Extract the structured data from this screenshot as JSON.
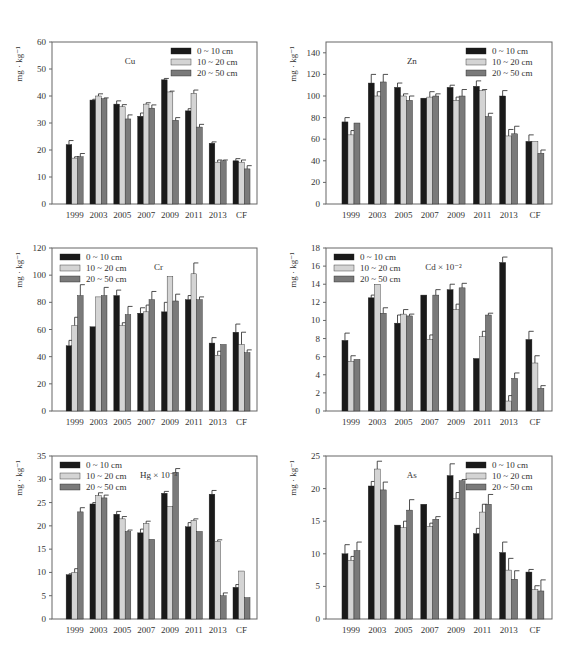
{
  "legend": [
    "0 ~ 10 cm",
    "10 ~ 20 cm",
    "20 ~ 50 cm"
  ],
  "colors": {
    "s1": "#1a1a1a",
    "s2": "#d4d4d4",
    "s3": "#7a7a7a",
    "axis": "#555555"
  },
  "chart_data": [
    {
      "type": "bar",
      "title": "Cu",
      "ylabel": "mg · kg⁻¹",
      "ylim": [
        0,
        60
      ],
      "yticks": [
        0,
        10,
        20,
        30,
        40,
        50,
        60
      ],
      "categories": [
        "1999",
        "2003",
        "2005",
        "2007",
        "2009",
        "2011",
        "2013",
        "CF"
      ],
      "legend_position": "top-right",
      "series": [
        {
          "name": "0 ~ 10 cm",
          "values": [
            22,
            38.5,
            37,
            32.5,
            46,
            34.5,
            22.5,
            16
          ],
          "errors": [
            1.5,
            0.3,
            1.2,
            1.2,
            0.5,
            0.8,
            0.5,
            0.8
          ]
        },
        {
          "name": "10 ~ 20 cm",
          "values": [
            17,
            40,
            36,
            37,
            41.5,
            41,
            15.5,
            15.5
          ],
          "errors": [
            0.5,
            0.8,
            0.8,
            0.5,
            0.3,
            1.2,
            0.8,
            0.8
          ]
        },
        {
          "name": "20 ~ 50 cm",
          "values": [
            17.5,
            39,
            31.5,
            35.5,
            31,
            28.5,
            16,
            13
          ],
          "errors": [
            1.2,
            0.3,
            1.5,
            1.2,
            1,
            1,
            0.3,
            1.2
          ]
        }
      ]
    },
    {
      "type": "bar",
      "title": "Zn",
      "ylabel": "mg · kg⁻¹",
      "ylim": [
        0,
        150
      ],
      "yticks": [
        0,
        20,
        40,
        60,
        80,
        100,
        120,
        140
      ],
      "categories": [
        "1999",
        "2003",
        "2005",
        "2007",
        "2009",
        "2011",
        "2013",
        "CF"
      ],
      "legend_position": "top-right",
      "series": [
        {
          "name": "0 ~ 10 cm",
          "values": [
            76,
            112,
            108,
            98,
            108,
            109,
            100,
            58
          ],
          "errors": [
            4,
            8,
            4,
            0,
            2,
            5,
            5,
            6
          ]
        },
        {
          "name": "10 ~ 20 cm",
          "values": [
            64,
            100,
            100,
            99,
            96,
            105,
            63,
            58
          ],
          "errors": [
            4,
            4,
            2,
            5,
            3,
            1,
            6,
            0
          ]
        },
        {
          "name": "20 ~ 50 cm",
          "values": [
            75,
            113,
            96,
            100,
            100,
            81,
            65,
            47
          ],
          "errors": [
            0,
            7,
            4,
            2,
            6,
            3,
            7,
            3
          ]
        }
      ]
    },
    {
      "type": "bar",
      "title": "Cr",
      "ylabel": "mg · kg⁻¹",
      "ylim": [
        0,
        120
      ],
      "yticks": [
        0,
        20,
        40,
        60,
        80,
        100,
        120
      ],
      "categories": [
        "1999",
        "2003",
        "2005",
        "2007",
        "2009",
        "2011",
        "2013",
        "CF"
      ],
      "legend_position": "top-left",
      "series": [
        {
          "name": "0 ~ 10 cm",
          "values": [
            48,
            62,
            85,
            72,
            73,
            82,
            50,
            58
          ],
          "errors": [
            4,
            0,
            4,
            4,
            7,
            3,
            4,
            6
          ]
        },
        {
          "name": "10 ~ 20 cm",
          "values": [
            63,
            84,
            63,
            73,
            99,
            101,
            41,
            49
          ],
          "errors": [
            6,
            0,
            2,
            5,
            0,
            8,
            3,
            9
          ]
        },
        {
          "name": "20 ~ 50 cm",
          "values": [
            85,
            85,
            71,
            82,
            81,
            82,
            49,
            43
          ],
          "errors": [
            8,
            6,
            6,
            6,
            5,
            2,
            0,
            2
          ]
        }
      ]
    },
    {
      "type": "bar",
      "title": "Cd × 10⁻²",
      "ylabel": "mg · kg⁻¹",
      "ylim": [
        0,
        18
      ],
      "yticks": [
        0,
        2,
        4,
        6,
        8,
        10,
        12,
        14,
        16,
        18
      ],
      "categories": [
        "1999",
        "2003",
        "2005",
        "2007",
        "2009",
        "2011",
        "2013",
        "CF"
      ],
      "legend_position": "top-left",
      "series": [
        {
          "name": "0 ~ 10 cm",
          "values": [
            7.8,
            12.5,
            9.7,
            12.8,
            13.4,
            5.8,
            16.4,
            7.9
          ],
          "errors": [
            0.8,
            0.3,
            0.9,
            0,
            0.6,
            0,
            0.6,
            0.9
          ]
        },
        {
          "name": "10 ~ 20 cm",
          "values": [
            5.5,
            14,
            10.7,
            7.9,
            11.2,
            8.2,
            1.1,
            5.3
          ],
          "errors": [
            0.6,
            0,
            0.5,
            0.5,
            0.6,
            0.6,
            0.6,
            0.8
          ]
        },
        {
          "name": "20 ~ 50 cm",
          "values": [
            5.7,
            10.8,
            10.5,
            12.8,
            13.6,
            10.6,
            3.6,
            2.5
          ],
          "errors": [
            0,
            0.6,
            0.2,
            0.6,
            0.5,
            0.2,
            0.6,
            0.3
          ]
        }
      ]
    },
    {
      "type": "bar",
      "title": "Hg × 10⁻³",
      "ylabel": "mg · kg⁻¹",
      "ylim": [
        0,
        35
      ],
      "yticks": [
        0,
        5,
        10,
        15,
        20,
        25,
        30,
        35
      ],
      "categories": [
        "1999",
        "2003",
        "2005",
        "2007",
        "2009",
        "2011",
        "2013",
        "CF"
      ],
      "legend_position": "top-left",
      "series": [
        {
          "name": "0 ~ 10 cm",
          "values": [
            9.5,
            24.7,
            22.5,
            18.5,
            27,
            19.8,
            26.8,
            6.8
          ],
          "errors": [
            0.2,
            0.3,
            0.6,
            0.8,
            0.4,
            0.9,
            0.8,
            0.6
          ]
        },
        {
          "name": "10 ~ 20 cm",
          "values": [
            10,
            26.5,
            21.5,
            20.5,
            24.2,
            21.2,
            16.7,
            10.3
          ],
          "errors": [
            0.8,
            0.6,
            0.5,
            0.5,
            0,
            0.3,
            0.3,
            0
          ]
        },
        {
          "name": "20 ~ 50 cm",
          "values": [
            23,
            26,
            18.8,
            17.1,
            31.5,
            18.8,
            5,
            4.6
          ],
          "errors": [
            0.9,
            0.6,
            0.3,
            0,
            0.8,
            0,
            0.6,
            0
          ]
        }
      ]
    },
    {
      "type": "bar",
      "title": "As",
      "ylabel": "mg · kg⁻¹",
      "ylim": [
        0,
        25
      ],
      "yticks": [
        0,
        5,
        10,
        15,
        20,
        25
      ],
      "categories": [
        "1999",
        "2003",
        "2005",
        "2007",
        "2009",
        "2011",
        "2013",
        "CF"
      ],
      "legend_position": "top-right",
      "series": [
        {
          "name": "0 ~ 10 cm",
          "values": [
            10,
            20.4,
            14.4,
            17.6,
            22,
            13.1,
            10.2,
            7.2
          ],
          "errors": [
            1.4,
            0.7,
            0,
            0,
            1.8,
            0.8,
            1.6,
            0.4
          ]
        },
        {
          "name": "10 ~ 20 cm",
          "values": [
            9,
            23,
            14,
            14.2,
            18.5,
            16.4,
            7.5,
            4.5
          ],
          "errors": [
            0.6,
            1.2,
            1,
            0.5,
            0.9,
            1.2,
            1.8,
            0.6
          ]
        },
        {
          "name": "20 ~ 50 cm",
          "values": [
            10.5,
            19.8,
            16.7,
            15.3,
            21.2,
            17.6,
            6.1,
            4.3
          ],
          "errors": [
            1.3,
            1.2,
            1.6,
            0.4,
            0.2,
            1.5,
            1.3,
            1.7
          ]
        }
      ]
    }
  ]
}
